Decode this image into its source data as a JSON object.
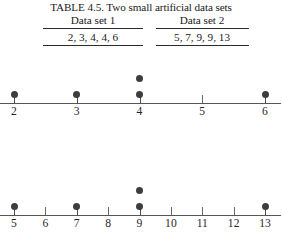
{
  "caption": "TABLE 4.5. Two small artificial data sets",
  "table": {
    "columns": [
      {
        "header": "Data set 1",
        "values_text": "2, 3, 4, 4, 6"
      },
      {
        "header": "Data set 2",
        "values_text": "5, 7, 9, 9, 13"
      }
    ]
  },
  "chart_data": [
    {
      "type": "scatter",
      "plot_style": "dotplot",
      "title": "Data set 1",
      "xlabel": "",
      "ylabel": "",
      "grid": false,
      "legend": null,
      "axis_ticks": [
        2,
        3,
        4,
        5,
        6
      ],
      "tick_labels": [
        "2",
        "3",
        "4",
        "5",
        "6"
      ],
      "xlim": [
        1.8,
        6.25
      ],
      "values": [
        2,
        3,
        4,
        4,
        6
      ],
      "stacks": [
        {
          "x": 2,
          "count": 1
        },
        {
          "x": 3,
          "count": 1
        },
        {
          "x": 4,
          "count": 2
        },
        {
          "x": 6,
          "count": 1
        }
      ],
      "dot_color": "#3d3d3d",
      "axis_color": "#555555"
    },
    {
      "type": "scatter",
      "plot_style": "dotplot",
      "title": "Data set 2",
      "xlabel": "",
      "ylabel": "",
      "grid": false,
      "legend": null,
      "axis_ticks": [
        5,
        6,
        7,
        8,
        9,
        10,
        11,
        12,
        13
      ],
      "tick_labels": [
        "5",
        "6",
        "7",
        "8",
        "9",
        "10",
        "11",
        "12",
        "13"
      ],
      "xlim": [
        4.6,
        13.55
      ],
      "values": [
        5,
        7,
        9,
        9,
        13
      ],
      "stacks": [
        {
          "x": 5,
          "count": 1
        },
        {
          "x": 7,
          "count": 1
        },
        {
          "x": 9,
          "count": 2
        },
        {
          "x": 13,
          "count": 1
        }
      ],
      "dot_color": "#3d3d3d",
      "axis_color": "#555555"
    }
  ]
}
